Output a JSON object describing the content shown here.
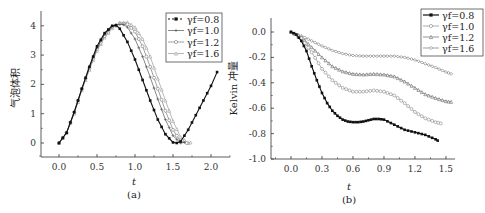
{
  "chart_data": [
    {
      "type": "line",
      "panel": "(a)",
      "title": "",
      "xlabel": "t",
      "ylabel": "气泡体积",
      "xlim": [
        -0.25,
        2.25
      ],
      "ylim": [
        -0.5,
        4.4
      ],
      "xticks": [
        "0.0",
        "0.5",
        "1.0",
        "1.5",
        "2.0"
      ],
      "yticks": [
        "0",
        "1",
        "2",
        "3",
        "4"
      ],
      "grid": false,
      "legend_position": "upper right",
      "series": [
        {
          "name": "γf=0.8",
          "marker": "filled-square",
          "color": "#111111",
          "x": [
            0.0,
            0.1,
            0.2,
            0.3,
            0.4,
            0.5,
            0.6,
            0.7,
            0.75,
            0.8,
            0.9,
            1.0,
            1.1,
            1.2,
            1.3,
            1.4,
            1.5,
            1.55,
            1.6,
            1.7,
            1.8,
            1.9,
            2.0,
            2.08
          ],
          "y": [
            0.0,
            0.35,
            1.05,
            1.85,
            2.6,
            3.3,
            3.75,
            4.0,
            4.02,
            3.9,
            3.45,
            2.85,
            2.15,
            1.45,
            0.8,
            0.3,
            0.02,
            0.0,
            0.05,
            0.45,
            0.95,
            1.45,
            1.95,
            2.42
          ]
        },
        {
          "name": "γf=1.0",
          "marker": "cross",
          "color": "#555555",
          "x": [
            0.0,
            0.1,
            0.2,
            0.3,
            0.4,
            0.5,
            0.6,
            0.7,
            0.8,
            0.85,
            0.9,
            1.0,
            1.1,
            1.2,
            1.3,
            1.4,
            1.5,
            1.6,
            1.65
          ],
          "y": [
            0.0,
            0.35,
            1.05,
            1.85,
            2.6,
            3.25,
            3.7,
            3.98,
            4.05,
            4.04,
            3.95,
            3.55,
            2.95,
            2.25,
            1.5,
            0.8,
            0.25,
            0.0,
            0.02
          ]
        },
        {
          "name": "γf=1.2",
          "marker": "open-circle",
          "color": "#777777",
          "x": [
            0.0,
            0.1,
            0.2,
            0.3,
            0.4,
            0.5,
            0.6,
            0.7,
            0.8,
            0.9,
            1.0,
            1.1,
            1.2,
            1.3,
            1.4,
            1.5,
            1.6,
            1.68
          ],
          "y": [
            0.0,
            0.35,
            1.05,
            1.85,
            2.55,
            3.2,
            3.65,
            3.95,
            4.08,
            4.05,
            3.8,
            3.3,
            2.6,
            1.85,
            1.1,
            0.45,
            0.05,
            0.0
          ]
        },
        {
          "name": "γf=1.6",
          "marker": "open-triangle",
          "color": "#999999",
          "x": [
            0.0,
            0.1,
            0.2,
            0.3,
            0.4,
            0.5,
            0.6,
            0.7,
            0.8,
            0.9,
            1.0,
            1.1,
            1.2,
            1.3,
            1.4,
            1.5,
            1.6,
            1.7,
            1.73
          ],
          "y": [
            0.0,
            0.35,
            1.0,
            1.8,
            2.5,
            3.15,
            3.6,
            3.92,
            4.1,
            4.12,
            3.95,
            3.55,
            2.95,
            2.2,
            1.45,
            0.75,
            0.2,
            0.0,
            0.02
          ]
        }
      ]
    },
    {
      "type": "line",
      "panel": "(b)",
      "title": "",
      "xlabel": "t",
      "ylabel": "Kelvin 冲量",
      "xlim": [
        -0.2,
        1.6
      ],
      "ylim": [
        -1.0,
        0.1
      ],
      "xticks": [
        "0.0",
        "0.3",
        "0.6",
        "0.9",
        "1.2",
        "1.5"
      ],
      "yticks": [
        "0.0",
        "-0.2",
        "-0.4",
        "-0.6",
        "-0.8",
        "-1.0"
      ],
      "grid": false,
      "legend_position": "upper right",
      "series": [
        {
          "name": "γf=0.8",
          "marker": "filled-square",
          "color": "#111111",
          "x": [
            0.0,
            0.05,
            0.1,
            0.15,
            0.2,
            0.25,
            0.3,
            0.35,
            0.4,
            0.45,
            0.5,
            0.55,
            0.6,
            0.65,
            0.7,
            0.75,
            0.8,
            0.85,
            0.9,
            1.0,
            1.1,
            1.2,
            1.3,
            1.4,
            1.42
          ],
          "y": [
            0.0,
            -0.02,
            -0.07,
            -0.15,
            -0.27,
            -0.38,
            -0.48,
            -0.56,
            -0.62,
            -0.66,
            -0.69,
            -0.705,
            -0.71,
            -0.71,
            -0.705,
            -0.695,
            -0.685,
            -0.685,
            -0.69,
            -0.73,
            -0.77,
            -0.79,
            -0.81,
            -0.845,
            -0.855
          ]
        },
        {
          "name": "γf=1.0",
          "marker": "open-circle",
          "color": "#888888",
          "x": [
            0.0,
            0.1,
            0.2,
            0.3,
            0.4,
            0.5,
            0.6,
            0.7,
            0.8,
            0.9,
            1.0,
            1.1,
            1.2,
            1.3,
            1.4,
            1.45
          ],
          "y": [
            0.0,
            -0.05,
            -0.16,
            -0.29,
            -0.38,
            -0.44,
            -0.47,
            -0.47,
            -0.46,
            -0.47,
            -0.5,
            -0.56,
            -0.63,
            -0.68,
            -0.71,
            -0.72
          ]
        },
        {
          "name": "γf=1.2",
          "marker": "open-triangle",
          "color": "#666666",
          "x": [
            0.0,
            0.1,
            0.2,
            0.3,
            0.4,
            0.5,
            0.6,
            0.7,
            0.8,
            0.9,
            1.0,
            1.1,
            1.2,
            1.3,
            1.4,
            1.5,
            1.55
          ],
          "y": [
            0.0,
            -0.04,
            -0.12,
            -0.2,
            -0.27,
            -0.31,
            -0.33,
            -0.335,
            -0.33,
            -0.335,
            -0.35,
            -0.39,
            -0.44,
            -0.49,
            -0.52,
            -0.545,
            -0.55
          ]
        },
        {
          "name": "γf=1.6",
          "marker": "open-diamond",
          "color": "#777777",
          "x": [
            0.0,
            0.1,
            0.2,
            0.3,
            0.4,
            0.5,
            0.6,
            0.7,
            0.8,
            0.9,
            1.0,
            1.1,
            1.2,
            1.3,
            1.4,
            1.5,
            1.55
          ],
          "y": [
            0.0,
            -0.03,
            -0.07,
            -0.11,
            -0.145,
            -0.17,
            -0.185,
            -0.19,
            -0.19,
            -0.19,
            -0.19,
            -0.2,
            -0.22,
            -0.25,
            -0.28,
            -0.315,
            -0.33
          ]
        }
      ]
    }
  ],
  "panels": {
    "a": {
      "label": "(a)",
      "xlabel": "t",
      "ylabel": "气泡体积",
      "legend": [
        "γf=0.8",
        "γf=1.0",
        "γf=1.2",
        "γf=1.6"
      ]
    },
    "b": {
      "label": "(b)",
      "xlabel": "t",
      "ylabel": "Kelvin 冲量",
      "legend": [
        "γf=0.8",
        "γf=1.0",
        "γf=1.2",
        "γf=1.6"
      ]
    }
  }
}
